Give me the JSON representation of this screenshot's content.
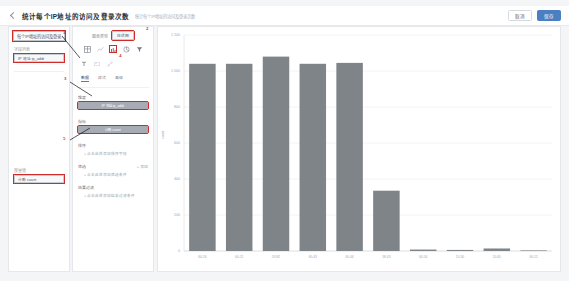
{
  "header": {
    "back_icon": "back-chevron-icon",
    "title": "统计每个IP地址的访问及登录次数",
    "subtitle": "统计每个IP地址的访问及登录次数",
    "cancel_label": "取消",
    "save_label": "保存"
  },
  "left_panel": {
    "dataset_value": "每个IP地址的访问及登录...",
    "fields_label": "字段列表",
    "field_chip": "IP 地址 ip_addr",
    "metrics_label": "度量值",
    "metric_chip": "计数 count"
  },
  "mid_panel": {
    "chart_type_label": "图表类型",
    "chart_type_value": "柱状图",
    "icons": [
      {
        "name": "table-view-icon",
        "selected": false
      },
      {
        "name": "line-chart-icon",
        "selected": false
      },
      {
        "name": "bar-chart-icon",
        "selected": true
      },
      {
        "name": "pie-chart-icon",
        "selected": false
      },
      {
        "name": "filter-funnel-icon",
        "selected": false
      }
    ],
    "tools": [
      {
        "name": "text-tool-icon"
      },
      {
        "name": "image-tool-icon"
      },
      {
        "name": "link-tool-icon"
      }
    ],
    "tabs": [
      {
        "label": "数据",
        "active": true
      },
      {
        "label": "样式",
        "active": false
      },
      {
        "label": "高级",
        "active": false
      }
    ],
    "sections": [
      {
        "title": "维度",
        "right": "",
        "chip": "IP 地址 ip_addr",
        "chip_visible": true,
        "sub": ""
      },
      {
        "title": "指标",
        "right": "",
        "chip": "计数 count",
        "chip_visible": true,
        "sub": ""
      },
      {
        "title": "排序",
        "right": "",
        "chip": "",
        "chip_visible": false,
        "sub": "+ 点击此处添加排序字段"
      },
      {
        "title": "筛选",
        "right": "+ 添加",
        "chip": "",
        "chip_visible": false,
        "sub": "+ 点击此处添加筛选条件"
      },
      {
        "title": "结果过滤",
        "right": "",
        "chip": "",
        "chip_visible": false,
        "sub": "+ 点击此处添加结果过滤条件"
      }
    ]
  },
  "annotations": [
    {
      "id": "1",
      "x": 63,
      "y": 32
    },
    {
      "id": "2",
      "x": 146,
      "y": 28
    },
    {
      "id": "3",
      "x": 64,
      "y": 77
    },
    {
      "id": "4",
      "x": 119,
      "y": 54
    },
    {
      "id": "5",
      "x": 63,
      "y": 137
    }
  ],
  "chart_data": {
    "type": "bar",
    "title": "",
    "xlabel": "",
    "ylabel": "count",
    "grid": true,
    "legend": false,
    "bar_color": "#7f8489",
    "categories": [
      "60.26",
      "60.21",
      "59.82",
      "60.43",
      "60.44",
      "58.43",
      "60.54",
      "10.30",
      "10.65",
      "60.12"
    ],
    "values": [
      1040,
      1040,
      1080,
      1040,
      1045,
      335,
      8,
      6,
      14,
      2
    ],
    "yticks": [
      0,
      200,
      400,
      600,
      800,
      1000,
      1200
    ],
    "ytick_labels": [
      "0",
      "200",
      "400",
      "600",
      "800",
      "1 000",
      "1 200"
    ],
    "ylim": [
      0,
      1200
    ]
  }
}
